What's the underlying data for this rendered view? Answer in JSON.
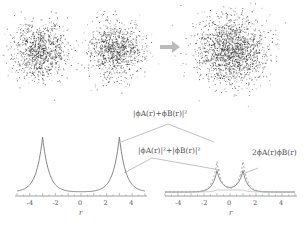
{
  "top": {
    "clouds": [
      {
        "name": "orbital-A",
        "cx": 40,
        "cy": 50,
        "r": 32
      },
      {
        "name": "orbital-B",
        "cx": 115,
        "cy": 50,
        "r": 32
      },
      {
        "name": "combined",
        "cx": 232,
        "cy": 50,
        "r": 40
      }
    ],
    "arrow_color": "#bbbbbb"
  },
  "annotations": {
    "sum_squared": "|ϕA(r)+ϕB(r)|²",
    "sum_of_squares": "|ϕA(r)|²+|ϕB(r)|²",
    "interference": "2ϕA(r)ϕB(r)"
  },
  "chart_data": [
    {
      "type": "line",
      "title": "",
      "xlabel": "r",
      "ylabel": "",
      "xlim": [
        -5,
        5
      ],
      "xticks": [
        "-4",
        "-2",
        "0",
        "2",
        "4"
      ],
      "series": [
        {
          "name": "|ϕA(r)|²+|ϕB(r)|²",
          "peaks_at": [
            -3,
            3
          ],
          "style": "solid"
        }
      ]
    },
    {
      "type": "line",
      "title": "",
      "xlabel": "r",
      "ylabel": "",
      "xlim": [
        -5,
        5
      ],
      "xticks": [
        "-4",
        "-2",
        "0",
        "2",
        "4"
      ],
      "series": [
        {
          "name": "|ϕA(r)+ϕB(r)|²",
          "peaks_at": [
            -1,
            1
          ],
          "style": "solid"
        },
        {
          "name": "|ϕA(r)|²+|ϕB(r)|²",
          "peaks_at": [
            -1,
            1
          ],
          "style": "dashed"
        },
        {
          "name": "2ϕA(r)ϕB(r)",
          "plateau": [
            -1,
            1
          ],
          "style": "solid-light"
        }
      ]
    }
  ]
}
